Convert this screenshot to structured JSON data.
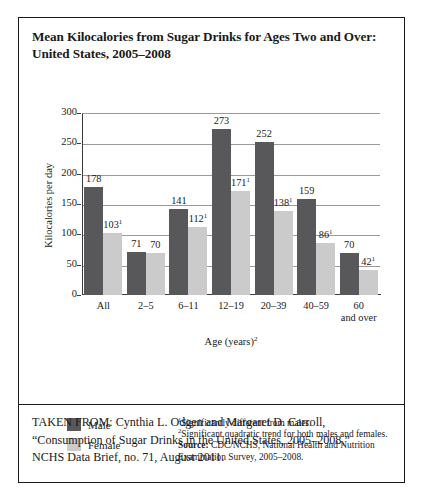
{
  "figure": {
    "title": "Mean Kilocalories from Sugar Drinks for Ages Two and Over: United States, 2005–2008",
    "citation_line1": "TAKEN FROM: Cynthia L. Odgen and Margaret D. Carroll,",
    "citation_line2": "“Consumption of Sugar Drinks in the United States, 2005–2008,”",
    "citation_line3": "NCHS Data Brief, no. 71, August 2011."
  },
  "footnotes": {
    "note1_marker": "1",
    "note1": "Significantly different from males.",
    "note2_marker": "2",
    "note2": "Significant quadratic trend for both males and females.",
    "source_label": "Source:",
    "source_text": " CDC/NCHS, National Health and Nutrition Examination Survey, 2005–2008."
  },
  "legend": {
    "male_label": "Male",
    "female_label": "Female",
    "male_color": "#58585a",
    "female_color": "#cbcbcb"
  },
  "chart_data": {
    "type": "bar",
    "title": "Mean Kilocalories from Sugar Drinks for Ages Two and Over: United States, 2005–2008",
    "xlabel": "Age (years)",
    "xlabel_marker": "2",
    "ylabel": "Kilocalories per day",
    "ylim": [
      0,
      300
    ],
    "yticks": [
      0,
      50,
      100,
      150,
      200,
      250,
      300
    ],
    "ytick_labels": [
      "0",
      "50",
      "100",
      "150",
      "200",
      "250",
      "300"
    ],
    "grid": true,
    "legend_position": "below-left",
    "categories": [
      "All",
      "2–5",
      "6–11",
      "12–19",
      "20–39",
      "40–59",
      "60 and over"
    ],
    "category_lines": [
      [
        "All"
      ],
      [
        "2–5"
      ],
      [
        "6–11"
      ],
      [
        "12–19"
      ],
      [
        "20–39"
      ],
      [
        "40–59"
      ],
      [
        "60",
        "and over"
      ]
    ],
    "series": [
      {
        "name": "Male",
        "color": "#58585a",
        "values": [
          178,
          71,
          141,
          273,
          252,
          159,
          70
        ],
        "labels": [
          "178",
          "71",
          "141",
          "273",
          "252",
          "159",
          "70"
        ],
        "markers": [
          "",
          "",
          "",
          "",
          "",
          "",
          ""
        ]
      },
      {
        "name": "Female",
        "color": "#cbcbcb",
        "values": [
          103,
          70,
          112,
          171,
          138,
          86,
          42
        ],
        "labels": [
          "103",
          "70",
          "112",
          "171",
          "138",
          "86",
          "42"
        ],
        "markers": [
          "1",
          "",
          "1",
          "1",
          "1",
          "1",
          "1"
        ]
      }
    ]
  }
}
